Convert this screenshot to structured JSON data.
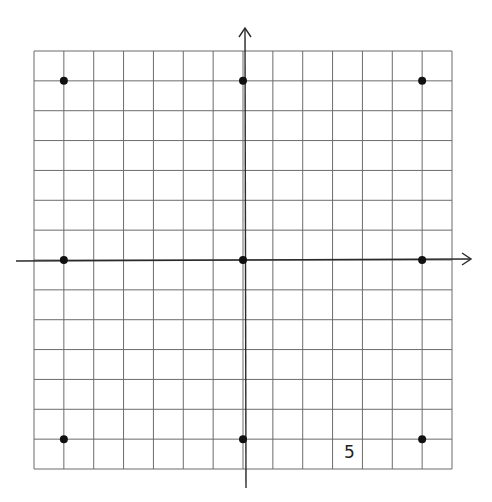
{
  "chart_data": {
    "type": "scatter",
    "title": "",
    "xlabel": "",
    "ylabel": "",
    "grid": true,
    "xlim": [
      -7,
      7
    ],
    "ylim": [
      -7,
      7
    ],
    "x": [
      -6,
      0,
      6,
      -6,
      0,
      6,
      -6,
      0,
      6
    ],
    "y": [
      6,
      6,
      6,
      0,
      0,
      0,
      -6,
      -6,
      -6
    ],
    "points": [
      {
        "x": -6,
        "y": 6
      },
      {
        "x": 0,
        "y": 6
      },
      {
        "x": 6,
        "y": 6
      },
      {
        "x": -6,
        "y": 0
      },
      {
        "x": 0,
        "y": 0
      },
      {
        "x": 6,
        "y": 0
      },
      {
        "x": -6,
        "y": -6
      },
      {
        "x": 0,
        "y": -6
      },
      {
        "x": 6,
        "y": -6
      }
    ],
    "annotations": [
      {
        "text": "5",
        "x": 3.5,
        "y": -6.5
      }
    ]
  },
  "labels": {
    "scale_label": "5"
  },
  "colors": {
    "grid": "#6b6b6b",
    "axis": "#2a2a2a",
    "point": "#111111"
  }
}
